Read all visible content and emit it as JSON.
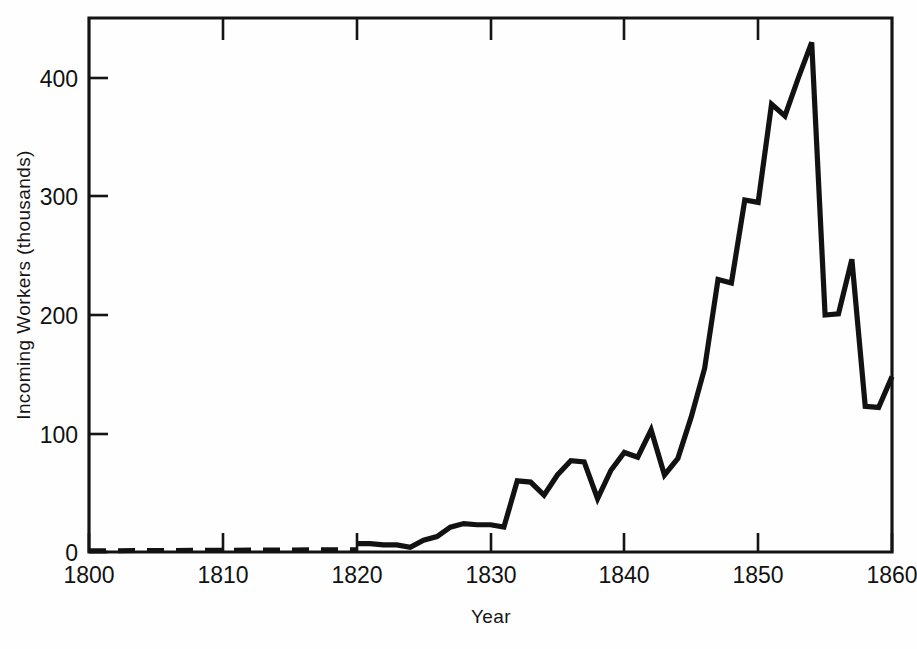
{
  "figure": {
    "background_color": "#fefefe",
    "line_color": "#121212",
    "axis_color": "#141414"
  },
  "chart_data": {
    "type": "line",
    "title": "",
    "xlabel": "Year",
    "ylabel": "Incoming Workers (thousands)",
    "xlim": [
      1800,
      1861
    ],
    "ylim": [
      0,
      460
    ],
    "grid": false,
    "legend": null,
    "x_ticks": [
      1800,
      1810,
      1820,
      1830,
      1840,
      1850,
      1860
    ],
    "x_tick_labels": [
      "1800",
      "1810",
      "1820",
      "1830",
      "1840",
      "1850",
      "1860"
    ],
    "y_ticks": [
      0,
      100,
      200,
      300,
      400
    ],
    "y_tick_labels": [
      "0",
      "100",
      "200",
      "300",
      "400"
    ],
    "series": [
      {
        "name": "estimated",
        "style": "dashed",
        "x": [
          1800,
          1820
        ],
        "values": [
          1,
          2
        ]
      },
      {
        "name": "recorded",
        "style": "solid",
        "x": [
          1820,
          1821,
          1822,
          1823,
          1824,
          1825,
          1826,
          1827,
          1828,
          1829,
          1830,
          1831,
          1832,
          1833,
          1834,
          1835,
          1836,
          1837,
          1838,
          1839,
          1840,
          1841,
          1842,
          1843,
          1844,
          1845,
          1846,
          1847,
          1848,
          1849,
          1850,
          1851,
          1852,
          1853,
          1854,
          1855,
          1856,
          1857,
          1858,
          1859,
          1860
        ],
        "values": [
          7,
          7,
          6,
          6,
          4,
          10,
          13,
          21,
          24,
          23,
          23,
          21,
          60,
          59,
          48,
          65,
          77,
          76,
          45,
          69,
          84,
          80,
          103,
          65,
          79,
          114,
          155,
          230,
          227,
          297,
          295,
          378,
          368,
          400,
          430,
          200,
          201,
          247,
          123,
          122,
          148
        ]
      }
    ],
    "annotations": []
  }
}
